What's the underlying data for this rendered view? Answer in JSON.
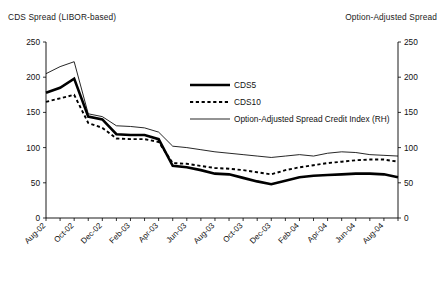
{
  "header": {
    "left_title": "CDS Spread (LIBOR-based)",
    "right_title": "Option-Adjusted Spread"
  },
  "legend": {
    "items": [
      {
        "label": "CDS5",
        "style": "thick-solid"
      },
      {
        "label": "CDS10",
        "style": "dashed"
      },
      {
        "label": "Option-Adjusted Spread Credit Index (RH)",
        "style": "thin-solid"
      }
    ]
  },
  "axes": {
    "left_ticks": [
      "250",
      "200",
      "150",
      "100",
      "50",
      "0"
    ],
    "right_ticks": [
      "250",
      "200",
      "150",
      "100",
      "50",
      "0"
    ],
    "x_ticks": [
      "Aug-02",
      "Oct-02",
      "Dec-02",
      "Feb-03",
      "Apr-03",
      "Jun-03",
      "Aug-03",
      "Oct-03",
      "Dec-03",
      "Feb-04",
      "Apr-04",
      "Jun-04",
      "Aug-04"
    ]
  },
  "chart_data": {
    "type": "line",
    "xlabel": "",
    "ylabel": "CDS Spread (LIBOR-based)",
    "y2label": "Option-Adjusted Spread",
    "ylim": [
      0,
      250
    ],
    "y2lim": [
      0,
      250
    ],
    "ytick_step": 50,
    "grid": false,
    "legend_position": "inside-top-right",
    "x": [
      "Aug-02",
      "Sep-02",
      "Oct-02",
      "Nov-02",
      "Dec-02",
      "Jan-03",
      "Feb-03",
      "Mar-03",
      "Apr-03",
      "May-03",
      "Jun-03",
      "Jul-03",
      "Aug-03",
      "Sep-03",
      "Oct-03",
      "Nov-03",
      "Dec-03",
      "Jan-04",
      "Feb-04",
      "Mar-04",
      "Apr-04",
      "May-04",
      "Jun-04",
      "Jul-04",
      "Aug-04",
      "Sep-04"
    ],
    "series": [
      {
        "name": "CDS5",
        "axis": "left",
        "style": "thick-solid",
        "values": [
          178,
          185,
          198,
          144,
          140,
          119,
          118,
          118,
          112,
          74,
          72,
          68,
          63,
          62,
          57,
          52,
          48,
          53,
          58,
          60,
          61,
          62,
          63,
          63,
          62,
          58
        ]
      },
      {
        "name": "CDS10",
        "axis": "left",
        "style": "dashed",
        "values": [
          165,
          170,
          175,
          135,
          128,
          113,
          112,
          112,
          108,
          78,
          77,
          74,
          71,
          70,
          68,
          65,
          62,
          68,
          72,
          75,
          78,
          80,
          82,
          83,
          83,
          80
        ]
      },
      {
        "name": "Option-Adjusted Spread Credit Index (RH)",
        "axis": "right",
        "style": "thin-solid",
        "values": [
          205,
          215,
          222,
          148,
          144,
          131,
          130,
          128,
          122,
          102,
          100,
          97,
          94,
          92,
          90,
          88,
          86,
          88,
          90,
          88,
          92,
          94,
          93,
          90,
          89,
          88
        ]
      }
    ]
  }
}
